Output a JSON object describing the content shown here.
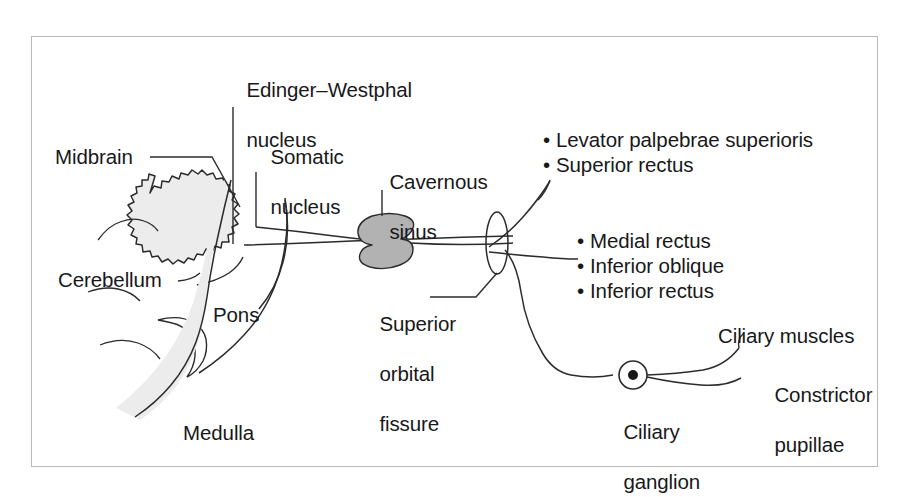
{
  "figure": {
    "border_color": "#b9b9bc",
    "background": "#ffffff",
    "stroke_color": "#2b2b2e",
    "structure_fill": "#ececec",
    "sinus_fill": "#b2b2b2",
    "text_color": "#18181a"
  },
  "labels": {
    "edinger_westphal_line1": "Edinger–Westphal",
    "edinger_westphal_line2": "nucleus",
    "somatic_line1": "Somatic",
    "somatic_line2": "nucleus",
    "midbrain": "Midbrain",
    "cerebellum": "Cerebellum",
    "pons": "Pons",
    "medulla": "Medulla",
    "cavernous_line1": "Cavernous",
    "cavernous_line2": "sinus",
    "sof_line1": "Superior",
    "sof_line2": "orbital",
    "sof_line3": "fissure",
    "ciliary_ganglion_line1": "Ciliary",
    "ciliary_ganglion_line2": "ganglion",
    "ciliary_muscles": "Ciliary muscles",
    "constrictor_line1": "Constrictor",
    "constrictor_line2": "pupillae"
  },
  "target_lists": {
    "superior_group": [
      "Levator palpebrae superioris",
      "Superior rectus"
    ],
    "inferior_group": [
      "Medial rectus",
      "Inferior oblique",
      "Inferior rectus"
    ],
    "bullet_glyph": "•"
  }
}
